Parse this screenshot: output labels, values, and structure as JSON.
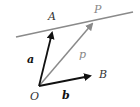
{
  "diagram": {
    "colors": {
      "background": "#ffffff",
      "line": "#8a8a8a",
      "vector_dark": "#111111",
      "vector_gray": "#8a8a8a",
      "label_gray": "#888888"
    },
    "points": {
      "O": {
        "label": "O",
        "x": 39,
        "y": 86
      },
      "A": {
        "label": "A",
        "x": 53,
        "y": 30
      },
      "B": {
        "label": "B",
        "x": 93,
        "y": 75
      },
      "P": {
        "label": "P",
        "x": 94,
        "y": 22
      }
    },
    "line": {
      "x1": 16,
      "y1": 37,
      "x2": 133,
      "y2": 12
    },
    "vectors": {
      "a": {
        "label": "a"
      },
      "b": {
        "label": "b"
      },
      "p": {
        "label": "p"
      }
    }
  }
}
